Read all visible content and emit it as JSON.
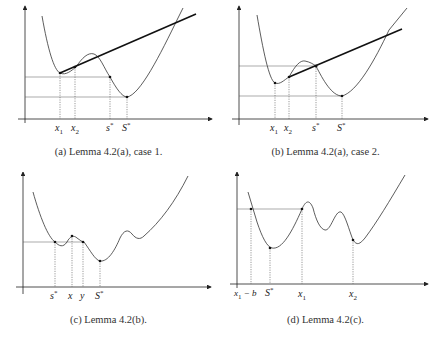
{
  "figure": {
    "panels": [
      {
        "id": "a",
        "caption": "(a) Lemma 4.2(a), case 1.",
        "labels": [
          "x1",
          "x2",
          "s*",
          "S*"
        ],
        "label_text": {
          "x1": "x",
          "x1_sub": "1",
          "x2": "x",
          "x2_sub": "2",
          "s": "s",
          "s_sup": "*",
          "S": "S",
          "S_sup": "*"
        },
        "has_tangent_line": true
      },
      {
        "id": "b",
        "caption": "(b) Lemma 4.2(a), case 2.",
        "labels": [
          "x1",
          "x2",
          "s*",
          "S*"
        ],
        "label_text": {
          "x1": "x",
          "x1_sub": "1",
          "x2": "x",
          "x2_sub": "2",
          "s": "s",
          "s_sup": "*",
          "S": "S",
          "S_sup": "*"
        },
        "has_tangent_line": true
      },
      {
        "id": "c",
        "caption": "(c) Lemma 4.2(b).",
        "labels": [
          "s*",
          "x",
          "y",
          "S*"
        ],
        "label_text": {
          "s": "s",
          "s_sup": "*",
          "x": "x",
          "y": "y",
          "S": "S",
          "S_sup": "*"
        },
        "has_tangent_line": false
      },
      {
        "id": "d",
        "caption": "(d) Lemma 4.2(c).",
        "labels": [
          "x1 - b",
          "S*",
          "x1",
          "x2"
        ],
        "label_text": {
          "x1b": "x",
          "x1b_sub": "1",
          "x1b_rest": " − b",
          "S": "S",
          "S_sup": "*",
          "x1": "x",
          "x1_sub": "1",
          "x2": "x",
          "x2_sub": "2"
        },
        "has_tangent_line": false
      }
    ]
  },
  "colors": {
    "curve": "#333333",
    "axis": "#222222",
    "guide": "#555555",
    "tangent": "#111111"
  }
}
